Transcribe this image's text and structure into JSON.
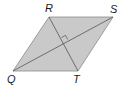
{
  "diagram": {
    "shape": "rhombus",
    "name": "QRST",
    "vertices": [
      {
        "label": "Q",
        "x": 13,
        "y": 71
      },
      {
        "label": "R",
        "x": 49,
        "y": 17
      },
      {
        "label": "S",
        "x": 113,
        "y": 17
      },
      {
        "label": "T",
        "x": 78,
        "y": 71
      }
    ],
    "diagonals": [
      {
        "from": "Q",
        "to": "S"
      },
      {
        "from": "R",
        "to": "T"
      }
    ],
    "right_angle_marker": {
      "at": "diagonal intersection",
      "x": 63,
      "y": 41
    },
    "colors": {
      "fill": "#c9c9c9",
      "edge": "#8a8a8a",
      "diagonal": "#555555",
      "label": "#1a1a1a"
    }
  },
  "labels": {
    "Q": "Q",
    "R": "R",
    "S": "S",
    "T": "T"
  }
}
